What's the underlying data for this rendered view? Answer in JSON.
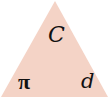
{
  "diagram": {
    "shape": "triangle",
    "fill_color": "#f4d3c6",
    "labels": {
      "top": "C",
      "bottom_left": "π",
      "bottom_right": "d"
    }
  }
}
